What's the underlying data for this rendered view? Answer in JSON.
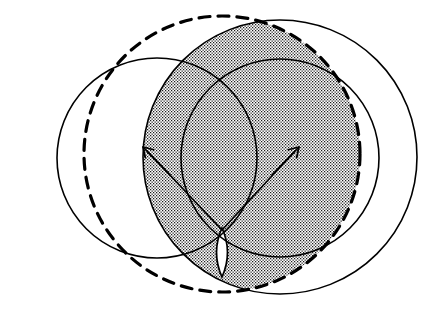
{
  "figure": {
    "type": "geometric-diagram",
    "canvas": {
      "width": 440,
      "height": 311,
      "background": "#ffffff"
    },
    "colors": {
      "stroke": "#000000",
      "background": "#ffffff",
      "shading_dot": "#000000",
      "shading_base": "#ffffff"
    },
    "shapes": [
      {
        "name": "outer-left-circle",
        "style": "dashed",
        "cx": 222,
        "cy": 154,
        "r": 138,
        "stroke_width": 3.2,
        "dash": "11 8"
      },
      {
        "name": "outer-right-circle",
        "style": "solid",
        "cx": 280,
        "cy": 157,
        "r": 137,
        "stroke_width": 1.6,
        "dash": ""
      },
      {
        "name": "inner-left-circle",
        "style": "solid",
        "cx": 157,
        "cy": 158,
        "r": 100,
        "stroke_width": 1.6,
        "dash": ""
      },
      {
        "name": "inner-right-circle",
        "style": "solid",
        "cx": 280,
        "cy": 158,
        "r": 99,
        "stroke_width": 1.6,
        "dash": ""
      }
    ],
    "shaded_region": {
      "name": "lens-intersection",
      "description": "Vertical lens where the dashed outer-left circle and the solid outer-right circle overlap",
      "top_vertex": {
        "x": 222,
        "y": 38
      },
      "bottom_vertex": {
        "x": 222,
        "y": 277
      },
      "left_extent": 152,
      "right_extent": 292,
      "fill": "dotted-stipple"
    },
    "white_lens": {
      "name": "small-white-lens",
      "description": "Small unshaded lens near the bottom where the two inner circles overlap",
      "top_vertex": {
        "x": 222,
        "y": 228
      },
      "bottom_vertex": {
        "x": 222,
        "y": 277
      },
      "half_width": 11
    },
    "markers": [
      {
        "name": "left-radius-arrow",
        "direction": "up-left",
        "tip": {
          "x": 143,
          "y": 147
        },
        "tail": {
          "x": 170,
          "y": 175
        }
      },
      {
        "name": "right-radius-arrow",
        "direction": "up-right",
        "tip": {
          "x": 299,
          "y": 147
        },
        "tail": {
          "x": 272,
          "y": 175
        }
      }
    ],
    "chord_lines": [
      {
        "name": "left-chord-line",
        "from": {
          "x": 148,
          "y": 152
        },
        "to": {
          "x": 222,
          "y": 230
        }
      },
      {
        "name": "right-chord-line",
        "from": {
          "x": 294,
          "y": 152
        },
        "to": {
          "x": 222,
          "y": 230
        }
      }
    ]
  }
}
